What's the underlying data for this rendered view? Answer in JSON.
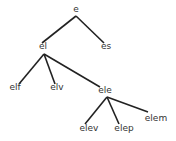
{
  "tree": {
    "nodes": [
      {
        "id": "e",
        "label": "e"
      },
      {
        "id": "el",
        "label": "el"
      },
      {
        "id": "es",
        "label": "es"
      },
      {
        "id": "elf",
        "label": "elf"
      },
      {
        "id": "elv",
        "label": "elv"
      },
      {
        "id": "ele",
        "label": "ele"
      },
      {
        "id": "elev",
        "label": "elev"
      },
      {
        "id": "elep",
        "label": "elep"
      },
      {
        "id": "elem",
        "label": "elem"
      }
    ],
    "edges": [
      [
        "e",
        "el"
      ],
      [
        "e",
        "es"
      ],
      [
        "el",
        "elf"
      ],
      [
        "el",
        "elv"
      ],
      [
        "el",
        "ele"
      ],
      [
        "ele",
        "elev"
      ],
      [
        "ele",
        "elep"
      ],
      [
        "ele",
        "elem"
      ]
    ],
    "colors": {
      "edge": "#222222",
      "text": "#333333"
    }
  }
}
